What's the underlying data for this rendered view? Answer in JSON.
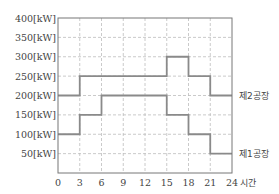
{
  "chart_data": {
    "type": "line",
    "subtype": "step",
    "title": "",
    "xlabel": "시간",
    "ylabel": "",
    "x_ticks": [
      "0",
      "3",
      "6",
      "9",
      "12",
      "15",
      "18",
      "21",
      "24"
    ],
    "y_ticks": [
      "50[kW]",
      "100[kW]",
      "150[kW]",
      "200[kW]",
      "250[kW]",
      "300[kW]",
      "350[kW]",
      "400[kW]"
    ],
    "xlim": [
      0,
      24
    ],
    "ylim": [
      0,
      400
    ],
    "grid": true,
    "legend_position": "inline-right",
    "series": [
      {
        "name": "제1공장",
        "x": [
          0,
          3,
          6,
          9,
          12,
          15,
          18,
          21,
          24
        ],
        "steps": [
          {
            "from": 0,
            "to": 3,
            "value": 100
          },
          {
            "from": 3,
            "to": 6,
            "value": 150
          },
          {
            "from": 6,
            "to": 15,
            "value": 200
          },
          {
            "from": 15,
            "to": 18,
            "value": 150
          },
          {
            "from": 18,
            "to": 21,
            "value": 100
          },
          {
            "from": 21,
            "to": 24,
            "value": 50
          }
        ]
      },
      {
        "name": "제2공장",
        "steps": [
          {
            "from": 0,
            "to": 3,
            "value": 200
          },
          {
            "from": 3,
            "to": 15,
            "value": 250
          },
          {
            "from": 15,
            "to": 18,
            "value": 300
          },
          {
            "from": 18,
            "to": 21,
            "value": 250
          },
          {
            "from": 21,
            "to": 24,
            "value": 200
          }
        ]
      }
    ]
  },
  "colors": {
    "line": "#8a8a8a",
    "grid": "#bdbdbd",
    "axis": "#777777"
  }
}
